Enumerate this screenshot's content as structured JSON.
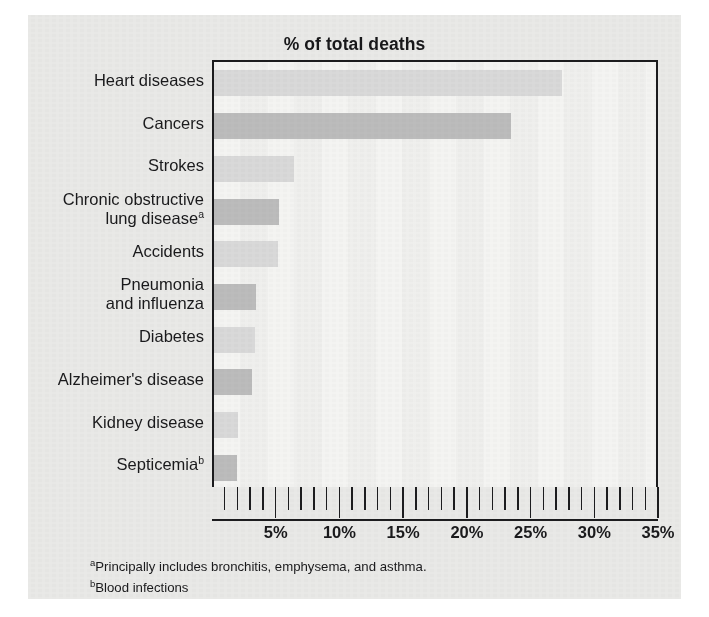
{
  "figure": {
    "title": "% of total deaths",
    "background_color": "#e9e9e7",
    "plot_background_color": "#f4f4f2",
    "axis_color": "#1c1c1e"
  },
  "footnotes": [
    {
      "marker": "a",
      "text": "Principally includes bronchitis, emphysema, and asthma."
    },
    {
      "marker": "b",
      "text": "Blood infections"
    }
  ],
  "chart_data": {
    "type": "bar",
    "orientation": "horizontal",
    "title": "% of total deaths",
    "xlabel": "",
    "ylabel": "",
    "xlim": [
      0,
      35
    ],
    "grid": false,
    "legend": "none",
    "major_tick_step": 5,
    "minor_tick_step": 1,
    "tick_labels": [
      "5%",
      "10%",
      "15%",
      "20%",
      "25%",
      "30%",
      "35%"
    ],
    "tick_values": [
      5,
      10,
      15,
      20,
      25,
      30,
      35
    ],
    "categories": [
      "Heart diseases",
      "Cancers",
      "Strokes",
      "Chronic obstructive lung disease",
      "Accidents",
      "Pneumonia and influenza",
      "Diabetes",
      "Alzheimer's disease",
      "Kidney disease",
      "Septicemia"
    ],
    "category_labels": [
      {
        "lines": [
          "Heart diseases"
        ],
        "footnote": ""
      },
      {
        "lines": [
          "Cancers"
        ],
        "footnote": ""
      },
      {
        "lines": [
          "Strokes"
        ],
        "footnote": ""
      },
      {
        "lines": [
          "Chronic obstructive",
          "lung disease"
        ],
        "footnote": "a"
      },
      {
        "lines": [
          "Accidents"
        ],
        "footnote": ""
      },
      {
        "lines": [
          "Pneumonia",
          "and influenza"
        ],
        "footnote": ""
      },
      {
        "lines": [
          "Diabetes"
        ],
        "footnote": ""
      },
      {
        "lines": [
          "Alzheimer's disease"
        ],
        "footnote": ""
      },
      {
        "lines": [
          "Kidney disease"
        ],
        "footnote": ""
      },
      {
        "lines": [
          "Septicemia"
        ],
        "footnote": "b"
      }
    ],
    "values": [
      27.3,
      23.3,
      6.3,
      5.1,
      5.0,
      3.3,
      3.2,
      3.0,
      1.9,
      1.8
    ],
    "bar_colors": [
      "#d9d9d9",
      "#bcbcbc",
      "#d9d9d9",
      "#bcbcbc",
      "#d9d9d9",
      "#bcbcbc",
      "#d9d9d9",
      "#bcbcbc",
      "#d9d9d9",
      "#bcbcbc"
    ]
  }
}
